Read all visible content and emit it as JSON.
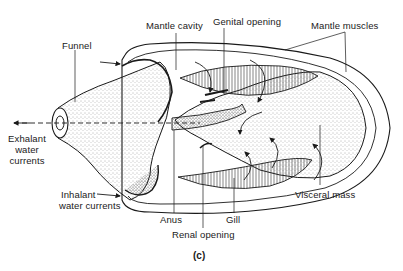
{
  "figure": {
    "caption": "(c)",
    "labels": {
      "mantle_cavity": "Mantle cavity",
      "genital_opening": "Genital opening",
      "mantle_muscles": "Mantle muscles",
      "funnel": "Funnel",
      "exhalant_line1": "Exhalant",
      "exhalant_line2": "water",
      "exhalant_line3": "currents",
      "inhalant_line1": "Inhalant",
      "inhalant_line2": "water currents",
      "anus": "Anus",
      "renal_opening": "Renal opening",
      "gill": "Gill",
      "visceral_mass": "Visceral mass"
    }
  },
  "colors": {
    "ink": "#1a1a1a",
    "stipple": "#555555",
    "background": "#ffffff"
  }
}
